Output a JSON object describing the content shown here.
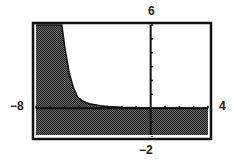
{
  "chart_data": {
    "type": "area",
    "title": "",
    "xlabel": "",
    "ylabel": "",
    "xlim": [
      -8,
      4
    ],
    "ylim": [
      -2,
      6
    ],
    "grid": false,
    "legend": null,
    "window_labels": {
      "xmin": "−8",
      "xmax": "4",
      "ymin": "−2",
      "ymax": "6"
    },
    "x_tick_step": 1,
    "y_tick_step": 1,
    "shading": "below curve (y ≤ f(x))",
    "series": [
      {
        "name": "boundary curve",
        "x": [
          -8,
          -6.2,
          -6.0,
          -5.7,
          -5.4,
          -5.1,
          -4.8,
          -4.5,
          -4.2,
          -3.9,
          -3.5,
          -3.0,
          -2.0,
          0,
          2,
          4
        ],
        "y": [
          6,
          6.0,
          4.4,
          2.6,
          1.5,
          0.8,
          0.55,
          0.4,
          0.3,
          0.25,
          0.18,
          0.12,
          0.06,
          0.02,
          0.01,
          0.0
        ]
      }
    ]
  },
  "labels": {
    "xmin": "−8",
    "xmax": "4",
    "ymax": "6",
    "ymin": "−2"
  }
}
